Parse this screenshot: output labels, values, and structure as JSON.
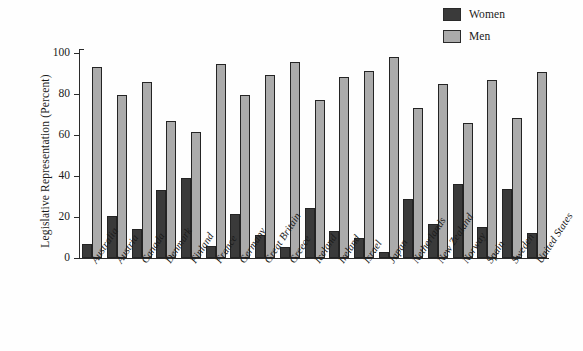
{
  "chart_data": {
    "type": "bar",
    "title": "",
    "xlabel": "",
    "ylabel": "Legislative Representation (Percent)",
    "ylim": [
      0,
      100
    ],
    "yticks": [
      0,
      20,
      40,
      60,
      80,
      100
    ],
    "grid": false,
    "legend_position": "top-right",
    "categories": [
      "Australia",
      "Austria",
      "Canada",
      "Denmark",
      "Finland",
      "France",
      "Germany",
      "Great Britain",
      "Greece",
      "Iceland",
      "Ireland",
      "Israel",
      "Japan",
      "Netherlands",
      "New Zealand",
      "Norway",
      "Spain",
      "Sweden",
      "United States"
    ],
    "series": [
      {
        "name": "Women",
        "color": "#3a3a3a",
        "values": [
          7,
          20.5,
          14,
          33,
          39,
          6,
          21.5,
          11,
          5.5,
          24.5,
          13,
          10,
          3,
          29,
          16.5,
          36,
          15,
          33.5,
          12
        ]
      },
      {
        "name": "Men",
        "color": "#ababab",
        "values": [
          93,
          79.5,
          86,
          67,
          61.5,
          94.5,
          79.5,
          89.5,
          95.5,
          77,
          88.5,
          91,
          98,
          73,
          85,
          66,
          87,
          68.5,
          90.5
        ]
      }
    ]
  },
  "legend": {
    "items": [
      {
        "label": "Women",
        "color": "#3a3a3a"
      },
      {
        "label": "Men",
        "color": "#ababab"
      }
    ]
  },
  "axes": {
    "y_title": "Legislative Representation (Percent)",
    "y_tick_labels": [
      "100",
      "80",
      "60",
      "40",
      "20",
      "0"
    ]
  }
}
